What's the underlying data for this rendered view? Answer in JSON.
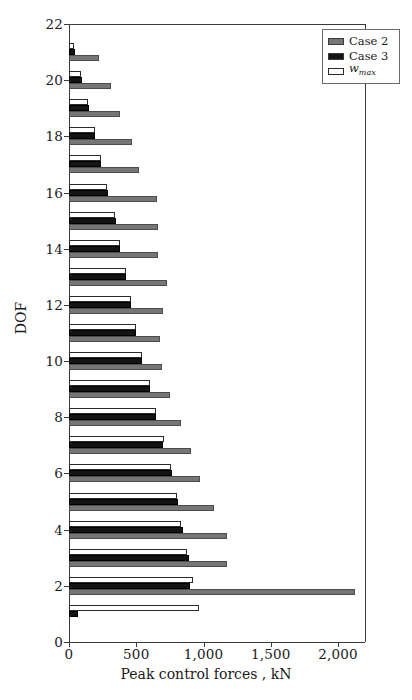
{
  "chart_data": {
    "type": "bar",
    "orientation": "horizontal",
    "title": "",
    "xlabel": "Peak control forces , kN",
    "ylabel": "DOF",
    "xlim": [
      0,
      2200
    ],
    "ylim": [
      0,
      22
    ],
    "xticks": [
      0,
      500,
      1000,
      1500,
      2000
    ],
    "xtick_labels": [
      "0",
      "500",
      "1,000",
      "1,500",
      "2,000"
    ],
    "yticks": [
      0,
      2,
      4,
      6,
      8,
      10,
      12,
      14,
      16,
      18,
      20,
      22
    ],
    "ytick_labels": [
      "0",
      "2",
      "4",
      "6",
      "8",
      "10",
      "12",
      "14",
      "16",
      "18",
      "20",
      "22"
    ],
    "grid": false,
    "legend_position": "top-right",
    "categories": [
      1,
      2,
      3,
      4,
      5,
      6,
      7,
      8,
      9,
      10,
      11,
      12,
      13,
      14,
      15,
      16,
      17,
      18,
      19,
      20,
      21
    ],
    "series": [
      {
        "name": "Case 2",
        "color": "#767676",
        "values": [
          0,
          2122,
          1177,
          1176,
          1074,
          973,
          905,
          831,
          750,
          689,
          680,
          700,
          730,
          662,
          665,
          655,
          520,
          466,
          378,
          310,
          223
        ]
      },
      {
        "name": "Case 3",
        "color": "#141414",
        "values": [
          68,
          900,
          890,
          845,
          810,
          762,
          700,
          645,
          600,
          540,
          500,
          460,
          420,
          380,
          350,
          290,
          240,
          195,
          145,
          95,
          45
        ]
      },
      {
        "name": "w_max",
        "color": "#ffffff",
        "values": [
          966,
          920,
          880,
          830,
          800,
          755,
          705,
          650,
          605,
          545,
          500,
          460,
          420,
          380,
          345,
          285,
          235,
          190,
          140,
          88,
          38
        ]
      }
    ]
  },
  "legend": {
    "entries": [
      {
        "label": "Case 2",
        "swatch": "#767676"
      },
      {
        "label": "Case 3",
        "swatch": "#141414"
      },
      {
        "label": "w",
        "sub": "max",
        "swatch": "#ffffff"
      }
    ]
  },
  "axes": {
    "x_title": "Peak control forces , kN",
    "y_title": "DOF"
  }
}
